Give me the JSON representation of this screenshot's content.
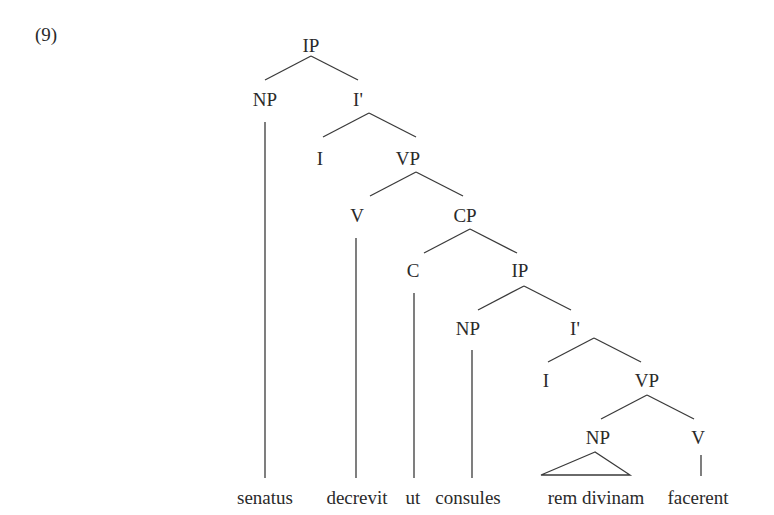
{
  "example_number": "(9)",
  "tree": {
    "nodes": [
      {
        "id": "ip1",
        "label": "IP",
        "x": 311,
        "y": 52
      },
      {
        "id": "np1",
        "label": "NP",
        "x": 265,
        "y": 106
      },
      {
        "id": "ibar1",
        "label": "I'",
        "x": 358,
        "y": 106
      },
      {
        "id": "i1",
        "label": "I",
        "x": 320,
        "y": 165
      },
      {
        "id": "vp1",
        "label": "VP",
        "x": 408,
        "y": 165
      },
      {
        "id": "v1",
        "label": "V",
        "x": 357,
        "y": 222
      },
      {
        "id": "cp1",
        "label": "CP",
        "x": 465,
        "y": 222
      },
      {
        "id": "c1",
        "label": "C",
        "x": 413,
        "y": 277
      },
      {
        "id": "ip2",
        "label": "IP",
        "x": 520,
        "y": 277
      },
      {
        "id": "np2",
        "label": "NP",
        "x": 468,
        "y": 335
      },
      {
        "id": "ibar2",
        "label": "I'",
        "x": 575,
        "y": 335
      },
      {
        "id": "i2",
        "label": "I",
        "x": 546,
        "y": 387
      },
      {
        "id": "vp2",
        "label": "VP",
        "x": 647,
        "y": 387
      },
      {
        "id": "np3",
        "label": "NP",
        "x": 598,
        "y": 444
      },
      {
        "id": "v2",
        "label": "V",
        "x": 698,
        "y": 444
      }
    ],
    "words": [
      {
        "id": "w-senatus",
        "text": "senatus",
        "x": 265,
        "y": 504
      },
      {
        "id": "w-decrevit",
        "text": "decrevit",
        "x": 357,
        "y": 504
      },
      {
        "id": "w-ut",
        "text": "ut",
        "x": 413,
        "y": 504
      },
      {
        "id": "w-consules",
        "text": "consules",
        "x": 468,
        "y": 504
      },
      {
        "id": "w-rem-divinam",
        "text": "rem divinam",
        "x": 596,
        "y": 504
      },
      {
        "id": "w-facerent",
        "text": "facerent",
        "x": 698,
        "y": 504
      }
    ],
    "branches": [
      {
        "from": [
          311,
          56
        ],
        "to": [
          265,
          80
        ]
      },
      {
        "from": [
          311,
          56
        ],
        "to": [
          358,
          80
        ]
      },
      {
        "from": [
          369,
          113
        ],
        "to": [
          323,
          137
        ]
      },
      {
        "from": [
          369,
          113
        ],
        "to": [
          416,
          137
        ]
      },
      {
        "from": [
          416,
          172
        ],
        "to": [
          370,
          196
        ]
      },
      {
        "from": [
          416,
          172
        ],
        "to": [
          463,
          196
        ]
      },
      {
        "from": [
          470,
          229
        ],
        "to": [
          424,
          253
        ]
      },
      {
        "from": [
          470,
          229
        ],
        "to": [
          517,
          253
        ]
      },
      {
        "from": [
          524,
          286
        ],
        "to": [
          478,
          310
        ]
      },
      {
        "from": [
          524,
          286
        ],
        "to": [
          571,
          310
        ]
      },
      {
        "from": [
          594,
          338
        ],
        "to": [
          548,
          362
        ]
      },
      {
        "from": [
          594,
          338
        ],
        "to": [
          641,
          362
        ]
      },
      {
        "from": [
          647,
          395
        ],
        "to": [
          601,
          419
        ]
      },
      {
        "from": [
          647,
          395
        ],
        "to": [
          694,
          419
        ]
      }
    ],
    "stems": [
      {
        "x": 265,
        "y1": 122,
        "y2": 478
      },
      {
        "x": 356,
        "y1": 238,
        "y2": 478
      },
      {
        "x": 414,
        "y1": 293,
        "y2": 478
      },
      {
        "x": 472,
        "y1": 350,
        "y2": 478
      },
      {
        "x": 701,
        "y1": 455,
        "y2": 476
      }
    ],
    "triangle": {
      "apex": [
        595,
        452
      ],
      "left": [
        541,
        475
      ],
      "right": [
        630,
        475
      ]
    }
  }
}
